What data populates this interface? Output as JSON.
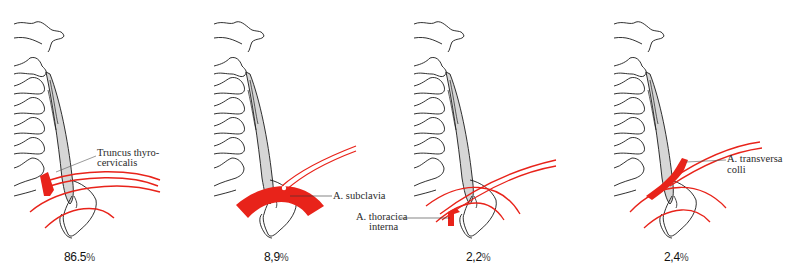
{
  "figure": {
    "colors": {
      "artery": "#e8231a",
      "muscle": "#d6d6d6",
      "outline": "#1a1a1a",
      "background": "#ffffff"
    },
    "panels": [
      {
        "id": "A",
        "labels": [
          "Truncus thyro-",
          "cervicalis"
        ],
        "percentage_value": "86.5",
        "percentage_sign": "%"
      },
      {
        "id": "B",
        "labels": [
          "A. subclavia"
        ],
        "percentage_value": "8,9",
        "percentage_sign": "%"
      },
      {
        "id": "C",
        "labels": [
          "A. thoracica",
          "interna"
        ],
        "percentage_value": "2,2",
        "percentage_sign": "%"
      },
      {
        "id": "D",
        "labels": [
          "A. transversa",
          "colli"
        ],
        "percentage_value": "2,4",
        "percentage_sign": "%"
      }
    ]
  }
}
